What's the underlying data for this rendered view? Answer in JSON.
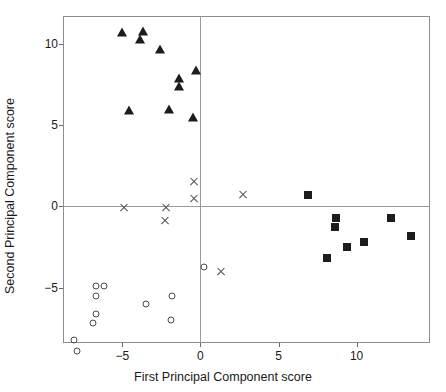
{
  "chart_data": {
    "type": "scatter",
    "title": "",
    "xlabel": "First Principal Component score",
    "ylabel": "Second Principal Component score",
    "xlim": [
      -8.8,
      14.7
    ],
    "ylim": [
      -8.4,
      11.7
    ],
    "xticks": [
      -5,
      0,
      5,
      10
    ],
    "xticklabels": [
      "-5",
      "0",
      "5",
      "10"
    ],
    "yticks": [
      -5,
      0,
      5,
      10
    ],
    "yticklabels": [
      "-5",
      "0",
      "5",
      "10"
    ],
    "grid": false,
    "reference_lines": {
      "vertical_x": 0,
      "horizontal_y": 0
    },
    "legend": null,
    "series": [
      {
        "name": "group-triangle",
        "marker": "triangle",
        "color": "#1c1c1c",
        "points": [
          [
            -5.0,
            10.7
          ],
          [
            -3.7,
            10.8
          ],
          [
            -3.9,
            10.3
          ],
          [
            -2.6,
            9.7
          ],
          [
            -1.4,
            7.9
          ],
          [
            -1.4,
            7.4
          ],
          [
            -0.3,
            8.4
          ],
          [
            -4.6,
            5.9
          ],
          [
            -2.0,
            6.0
          ],
          [
            -0.5,
            5.5
          ]
        ]
      },
      {
        "name": "group-cross",
        "marker": "cross",
        "color": "#4a4a4a",
        "points": [
          [
            -4.9,
            -0.1
          ],
          [
            -2.2,
            -0.1
          ],
          [
            -2.3,
            -0.9
          ],
          [
            -0.4,
            1.5
          ],
          [
            -0.4,
            0.5
          ],
          [
            2.7,
            0.7
          ],
          [
            1.3,
            -4.0
          ]
        ]
      },
      {
        "name": "group-circle",
        "marker": "circle",
        "color": "#4a4a4a",
        "points": [
          [
            -6.7,
            -4.9
          ],
          [
            -6.2,
            -4.9
          ],
          [
            -6.7,
            -5.5
          ],
          [
            -6.7,
            -6.6
          ],
          [
            -6.9,
            -7.2
          ],
          [
            -8.1,
            -8.2
          ],
          [
            -7.9,
            -8.9
          ],
          [
            -3.5,
            -6.0
          ],
          [
            -1.8,
            -5.5
          ],
          [
            -1.9,
            -7.0
          ],
          [
            0.2,
            -3.7
          ]
        ]
      },
      {
        "name": "group-square",
        "marker": "square",
        "color": "#1c1c1c",
        "points": [
          [
            6.9,
            0.7
          ],
          [
            8.7,
            -0.7
          ],
          [
            8.6,
            -1.3
          ],
          [
            9.4,
            -2.5
          ],
          [
            8.1,
            -3.2
          ],
          [
            10.5,
            -2.2
          ],
          [
            12.2,
            -0.7
          ],
          [
            13.5,
            -1.8
          ]
        ]
      }
    ]
  }
}
